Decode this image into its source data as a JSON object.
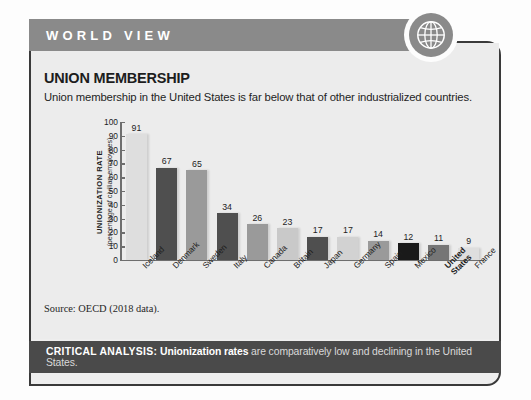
{
  "header": {
    "banner_label": "WORLD VIEW",
    "globe_icon": "globe-icon",
    "banner_color": "#8a8a8a"
  },
  "content": {
    "title": "UNION MEMBERSHIP",
    "subtitle": "Union membership in the United States is far below that of other industrialized countries.",
    "source": "Source: OECD (2018 data)."
  },
  "footer": {
    "label": "CRITICAL ANALYSIS:",
    "emphasis": "Unionization rates",
    "rest": " are comparatively low and declining in the United States.",
    "banner_color": "#4a4a4a"
  },
  "chart_data": {
    "type": "bar",
    "title": "UNION MEMBERSHIP",
    "subtitle": "Union membership in the United States is far below that of other industrialized countries.",
    "ylabel": "UNIONIZATION RATE",
    "ylabel_sub": "(percentage of civilian employees)",
    "xlabel": "",
    "ylim": [
      0,
      100
    ],
    "yticks": [
      100,
      90,
      80,
      70,
      60,
      50,
      40,
      30,
      20,
      10,
      0
    ],
    "grid": false,
    "legend": "none",
    "categories": [
      "Iceland",
      "Denmark",
      "Sweden",
      "Italy",
      "Canada",
      "Britain",
      "Japan",
      "Germany",
      "Spain",
      "Mexico",
      "United States",
      "France"
    ],
    "values": [
      91,
      67,
      65,
      34,
      26,
      23,
      17,
      17,
      14,
      12,
      11,
      9
    ],
    "bar_colors": [
      "#dedede",
      "#4f4f4f",
      "#9a9a9a",
      "#4f4f4f",
      "#9a9a9a",
      "#c9c9c9",
      "#4f4f4f",
      "#d2d2d2",
      "#9a9a9a",
      "#1a1a1a",
      "#767676",
      "#dedede"
    ],
    "highlight_category": "United States",
    "source": "Source: OECD (2018 data)."
  }
}
